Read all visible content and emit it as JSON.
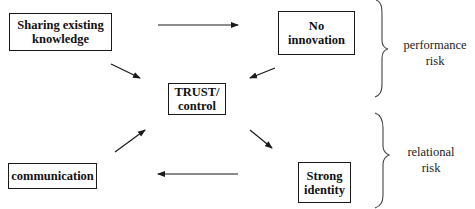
{
  "diagram": {
    "nodes": [
      {
        "id": "sharing",
        "label": "Sharing existing\nknowledge"
      },
      {
        "id": "no_innovation",
        "label": "No\ninnovation"
      },
      {
        "id": "trust",
        "label": "TRUST/\ncontrol"
      },
      {
        "id": "strong_identity",
        "label": "Strong\nidentity"
      },
      {
        "id": "communication",
        "label": "communication"
      }
    ],
    "edges": [
      {
        "from": "sharing",
        "to": "no_innovation"
      },
      {
        "from": "sharing",
        "to": "trust"
      },
      {
        "from": "no_innovation",
        "to": "trust"
      },
      {
        "from": "communication",
        "to": "trust"
      },
      {
        "from": "trust",
        "to": "strong_identity"
      },
      {
        "from": "strong_identity",
        "to": "communication"
      }
    ],
    "groups": [
      {
        "id": "performance_risk",
        "label": "performance\nrisk",
        "covers": [
          "sharing",
          "no_innovation"
        ]
      },
      {
        "id": "relational_risk",
        "label": "relational\nrisk",
        "covers": [
          "strong_identity",
          "communication"
        ]
      }
    ],
    "line_color": "#1a1a1a"
  }
}
